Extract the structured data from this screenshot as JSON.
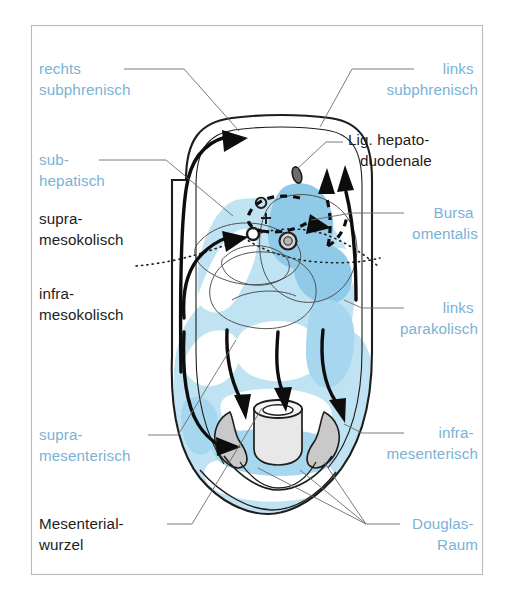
{
  "figure": {
    "frame": {
      "x": 31,
      "y": 25,
      "width": 452,
      "height": 550
    }
  },
  "colors": {
    "label_blue": "#7ab2d6",
    "label_black": "#1d1d1b",
    "fill_light_blue": "#bfe3f3",
    "fill_mid_blue": "#8fcbe8",
    "fill_gray": "#c9c9c9",
    "outline_black": "#1d1d1b",
    "leader_gray": "#6b6b6b",
    "frame_gray": "#b9b9b9",
    "background": "#ffffff"
  },
  "labels": [
    {
      "id": "rechts-subphrenisch",
      "color": "blue",
      "align": "start",
      "x": 39,
      "y": 74,
      "lines": [
        "rechts",
        "subphrenisch"
      ]
    },
    {
      "id": "sub-hepatisch",
      "color": "blue",
      "align": "start",
      "x": 39,
      "y": 165,
      "lines": [
        "sub-",
        "hepatisch"
      ]
    },
    {
      "id": "supra-mesokolisch",
      "color": "black",
      "align": "start",
      "x": 39,
      "y": 224,
      "lines": [
        "supra-",
        "mesokolisch"
      ]
    },
    {
      "id": "infra-mesokolisch",
      "color": "black",
      "align": "start",
      "x": 39,
      "y": 299,
      "lines": [
        "infra-",
        "mesokolisch"
      ]
    },
    {
      "id": "supra-mesenterisch",
      "color": "blue",
      "align": "start",
      "x": 39,
      "y": 440,
      "lines": [
        "supra-",
        "mesenterisch"
      ]
    },
    {
      "id": "mesenterial-wurzel",
      "color": "black",
      "align": "start",
      "x": 39,
      "y": 529,
      "lines": [
        "Mesenterial-",
        "wurzel"
      ]
    },
    {
      "id": "links-subphrenisch",
      "color": "blue",
      "align": "end",
      "x": 478,
      "y": 74,
      "lines": [
        "links",
        "subphrenisch"
      ]
    },
    {
      "id": "lig-hepatoduodenale",
      "color": "black",
      "align": "start",
      "x": 348,
      "y": 145,
      "lines": [
        "Lig. hepato-",
        "duodenale"
      ]
    },
    {
      "id": "bursa-omentalis",
      "color": "blue",
      "align": "end",
      "x": 478,
      "y": 218,
      "lines": [
        "Bursa",
        "omentalis"
      ]
    },
    {
      "id": "links-parakolisch",
      "color": "blue",
      "align": "end",
      "x": 478,
      "y": 313,
      "lines": [
        "links",
        "parakolisch"
      ]
    },
    {
      "id": "infra-mesenterisch",
      "color": "blue",
      "align": "end",
      "x": 478,
      "y": 438,
      "lines": [
        "infra-",
        "mesenterisch"
      ]
    },
    {
      "id": "douglas-raum",
      "color": "blue",
      "align": "end",
      "x": 478,
      "y": 529,
      "lines": [
        "Douglas-",
        "Raum"
      ]
    }
  ],
  "leader_lines": [
    {
      "id": "leader-rechts-subphrenisch",
      "d": "M 124 69 L 184 69 L 239 131"
    },
    {
      "id": "leader-sub-hepatisch",
      "d": "M 99 160 L 166 160 L 233 216"
    },
    {
      "id": "leader-links-subphrenisch",
      "d": "M 414 69 L 352 69 L 320 127"
    },
    {
      "id": "leader-lig-hepatoduodenale",
      "d": "M 343 142 L 326 142 L 296 170"
    },
    {
      "id": "leader-bursa-omentalis",
      "d": "M 404 213 L 352 213 L 311 220"
    },
    {
      "id": "leader-links-parakolisch",
      "d": "M 404 308 L 362 308 L 344 300"
    },
    {
      "id": "leader-infra-mesenterisch",
      "d": "M 404 433 L 362 433 L 344 424"
    },
    {
      "id": "leader-supra-mesenterisch",
      "d": "M 148 435 L 178 435 L 236 340"
    },
    {
      "id": "leader-mesenterial-wurzel",
      "d": "M 167 524 L 192 524 L 262 408"
    },
    {
      "id": "leader-douglas-raum-1",
      "d": "M 400 524 L 366 524 L 258 468"
    },
    {
      "id": "leader-douglas-raum-2",
      "d": "M 366 524 L 300 470"
    },
    {
      "id": "leader-douglas-raum-3",
      "d": "M 366 524 L 324 462"
    }
  ],
  "compartments": [
    {
      "id": "rechts-subphrenisch",
      "side": "left",
      "text_color": "blue"
    },
    {
      "id": "sub-hepatisch",
      "side": "left",
      "text_color": "blue"
    },
    {
      "id": "supra-mesokolisch",
      "side": "left",
      "text_color": "black"
    },
    {
      "id": "infra-mesokolisch",
      "side": "left",
      "text_color": "black"
    },
    {
      "id": "supra-mesenterisch",
      "side": "left",
      "text_color": "blue"
    },
    {
      "id": "mesenterial-wurzel",
      "side": "left",
      "text_color": "black"
    },
    {
      "id": "links-subphrenisch",
      "side": "right",
      "text_color": "blue"
    },
    {
      "id": "lig-hepatoduodenale",
      "side": "right",
      "text_color": "black"
    },
    {
      "id": "bursa-omentalis",
      "side": "right",
      "text_color": "blue"
    },
    {
      "id": "links-parakolisch",
      "side": "right",
      "text_color": "blue"
    },
    {
      "id": "infra-mesenterisch",
      "side": "right",
      "text_color": "blue"
    },
    {
      "id": "douglas-raum",
      "side": "right",
      "text_color": "blue"
    }
  ],
  "flow_arrows": [
    {
      "id": "flow-right-ascending",
      "style": "solid",
      "direction": "up"
    },
    {
      "id": "flow-right-subhepatic",
      "style": "solid",
      "direction": "up-right"
    },
    {
      "id": "flow-bursa-left",
      "style": "dashed",
      "direction": "left-down"
    },
    {
      "id": "flow-bursa-up",
      "style": "dashed",
      "direction": "up"
    },
    {
      "id": "flow-left-parakolisch",
      "style": "solid",
      "direction": "up"
    },
    {
      "id": "flow-descend-left",
      "style": "solid",
      "direction": "down"
    },
    {
      "id": "flow-descend-center-a",
      "style": "solid",
      "direction": "down"
    },
    {
      "id": "flow-descend-center-b",
      "style": "solid",
      "direction": "down"
    },
    {
      "id": "flow-descend-right",
      "style": "solid",
      "direction": "down"
    }
  ]
}
